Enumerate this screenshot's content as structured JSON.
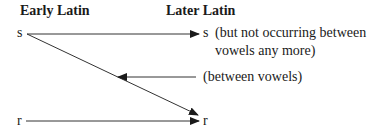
{
  "headers": {
    "left": "Early Latin",
    "right": "Later Latin"
  },
  "nodes": {
    "early_s": "s",
    "early_r": "r",
    "later_s": "s",
    "later_r": "r"
  },
  "annotations": {
    "s_note_line1": "(but not occurring between",
    "s_note_line2": "vowels any more)",
    "between_vowels": "(between vowels)"
  },
  "edges": [
    {
      "from": "early_s",
      "to": "later_s",
      "label": "s_note"
    },
    {
      "from": "early_s",
      "to": "later_r",
      "label": "between_vowels"
    },
    {
      "from": "early_r",
      "to": "later_r"
    }
  ],
  "colors": {
    "ink": "#1a1a1a",
    "line": "#333333"
  }
}
